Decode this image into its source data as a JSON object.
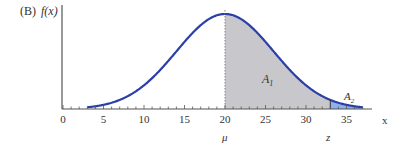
{
  "panel_label": "(B)",
  "y_axis_label": "f(x)",
  "x_axis_label": "x",
  "mu_label": "μ",
  "z_label": "z",
  "area1_label": "A",
  "area1_sub": "1",
  "area2_label": "A",
  "area2_sub": "2",
  "colors": {
    "curve": "#2b3fa8",
    "area1": "#c8c8cc",
    "area2": "#8fb0e8",
    "axis": "#555555"
  },
  "chart_data": {
    "type": "area",
    "title": "",
    "xlabel": "x",
    "ylabel": "f(x)",
    "xlim": [
      0,
      37
    ],
    "x_ticks": [
      0,
      5,
      10,
      15,
      20,
      25,
      30,
      35
    ],
    "x_tick_labels": [
      "0",
      "5",
      "10",
      "15",
      "20",
      "25",
      "30",
      "35"
    ],
    "minor_tick_step": 1,
    "distribution": {
      "kind": "normal",
      "mean": 20,
      "sd": 6
    },
    "curve_range": [
      3,
      37
    ],
    "mu": 20,
    "z": 33,
    "shaded_regions": [
      {
        "name": "A1",
        "from": 20,
        "to": 33
      },
      {
        "name": "A2",
        "from": 33,
        "to": 37
      }
    ]
  }
}
